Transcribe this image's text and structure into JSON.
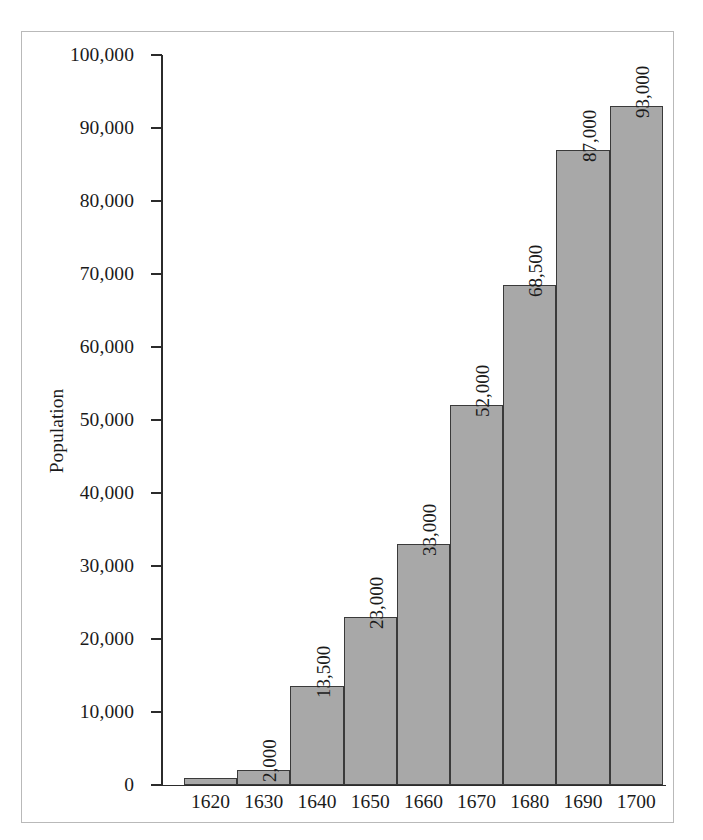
{
  "chart_data": {
    "type": "bar",
    "title": "",
    "xlabel": "",
    "ylabel": "Population",
    "categories": [
      "1620",
      "1630",
      "1640",
      "1650",
      "1660",
      "1670",
      "1680",
      "1690",
      "1700"
    ],
    "values": [
      1000,
      2000,
      13500,
      23000,
      33000,
      52000,
      68500,
      87000,
      93000
    ],
    "value_labels": [
      "",
      "2,000",
      "13,500",
      "23,000",
      "33,000",
      "52,000",
      "68,500",
      "87,000",
      "93,000"
    ],
    "ylim": [
      0,
      100000
    ],
    "ytick_values": [
      0,
      10000,
      20000,
      30000,
      40000,
      50000,
      60000,
      70000,
      80000,
      90000,
      100000
    ],
    "ytick_labels": [
      "0",
      "10,000",
      "20,000",
      "30,000",
      "40,000",
      "50,000",
      "60,000",
      "70,000",
      "80,000",
      "90,000",
      "100,000"
    ],
    "grid": false,
    "legend": "none",
    "bar_color": "#a8a8a8",
    "bar_border_color": "#3a3a3a",
    "axis_color": "#2b2b2b",
    "frame_color": "#b9b9b9",
    "background_color": "#ffffff",
    "value_label_rotation": -90
  }
}
